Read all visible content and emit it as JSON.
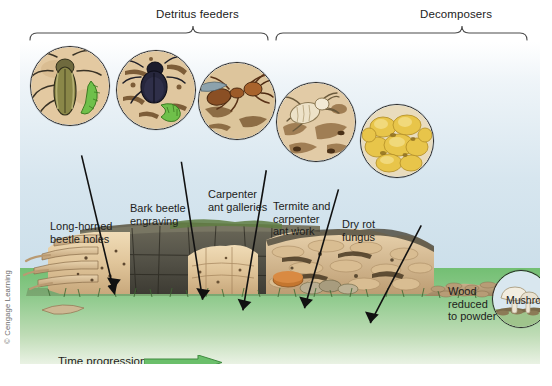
{
  "figure": {
    "brackets": [
      {
        "id": "detritus",
        "label": "Detritus feeders"
      },
      {
        "id": "decomposers",
        "label": "Decomposers"
      }
    ],
    "insets": [
      {
        "id": "long-horned-beetle",
        "name": "long-horned beetle and larva"
      },
      {
        "id": "bark-beetle",
        "name": "bark beetle and larva"
      },
      {
        "id": "carpenter-ant",
        "name": "carpenter ant in gallery"
      },
      {
        "id": "termite",
        "name": "termite and carpenter ant work"
      },
      {
        "id": "dry-rot-fungus",
        "name": "dry rot fungus"
      },
      {
        "id": "mushroom",
        "name": "mushroom on soil"
      }
    ],
    "callouts": [
      {
        "id": "long-horned",
        "text": "Long-horned\nbeetle holes"
      },
      {
        "id": "bark-beetle",
        "text": "Bark beetle\nengraving"
      },
      {
        "id": "carpenter-ant",
        "text": "Carpenter\nant galleries"
      },
      {
        "id": "termite",
        "text": "Termite and\ncarpenter\nant work"
      },
      {
        "id": "dry-rot",
        "text": "Dry rot\nfungus"
      },
      {
        "id": "wood-powder",
        "text": "Wood\nreduced\nto powder"
      },
      {
        "id": "mushroom",
        "text": "Mushroom"
      },
      {
        "id": "powder-broken",
        "text": "Powder broken down by\ndecomposers into plant\nnutrients in soil"
      }
    ],
    "time_progression": {
      "label": "Time progression",
      "arrow_color": "#6bbf6b"
    },
    "credit": "© Cengage Learning",
    "colors": {
      "sky_top": "#ffffff",
      "sky_bottom": "#ccdfea",
      "grass": "#73bf73",
      "log_bark": "#5d5b4e",
      "log_wood": "#e4cda4",
      "bracket_line": "#4a4a4a",
      "leader_line": "#111111",
      "fungus_yellow": "#e8c54a"
    }
  }
}
